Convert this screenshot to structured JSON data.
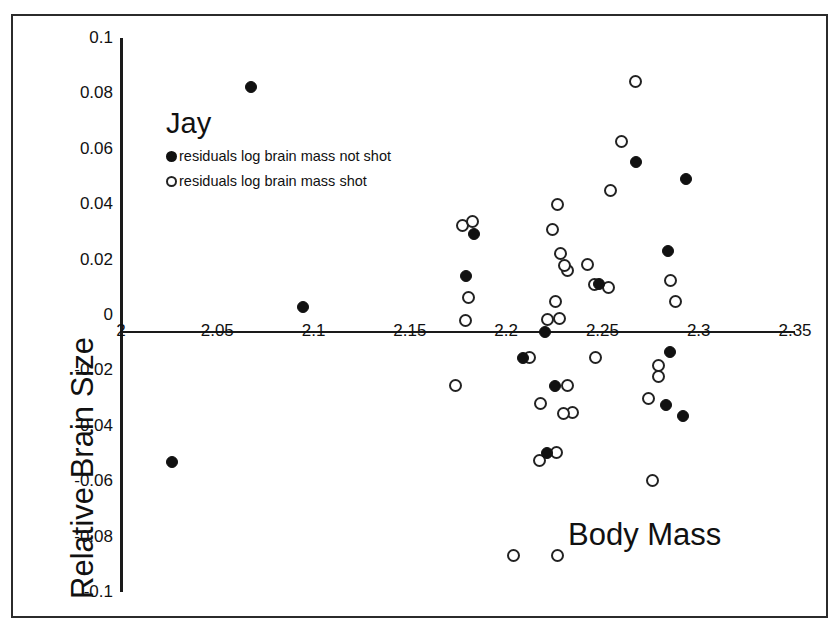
{
  "chart_data": {
    "type": "scatter",
    "title": "Jay",
    "xlabel": "Body Mass",
    "ylabel": "Relative Brain Size",
    "xlim": [
      2.0,
      2.35
    ],
    "ylim": [
      -0.1,
      0.1
    ],
    "xticks": [
      "2",
      "2.05",
      "2.1",
      "2.15",
      "2.2",
      "2.25",
      "2.3",
      "2.35"
    ],
    "xtick_values": [
      2.0,
      2.05,
      2.1,
      2.15,
      2.2,
      2.25,
      2.3,
      2.35
    ],
    "yticks": [
      "0.1",
      "0.08",
      "0.06",
      "0.04",
      "0.02",
      "0",
      "-0.02",
      "-0.04",
      "-0.06",
      "-0.08",
      "-0.1"
    ],
    "ytick_values": [
      0.1,
      0.08,
      0.06,
      0.04,
      0.02,
      0,
      -0.02,
      -0.04,
      -0.06,
      -0.08,
      -0.1
    ],
    "grid": false,
    "legend_position": "upper-left",
    "series": [
      {
        "name": "residuals log brain mass not shot",
        "marker": "filled-circle",
        "color": "#111111",
        "points": [
          [
            2.0675,
            0.0822
          ],
          [
            2.0945,
            0.003
          ],
          [
            2.0265,
            -0.0532
          ],
          [
            2.1835,
            0.0292
          ],
          [
            2.179,
            0.0141
          ],
          [
            2.2085,
            -0.0154
          ],
          [
            2.22,
            -0.0062
          ],
          [
            2.2255,
            -0.0258
          ],
          [
            2.221,
            -0.0497
          ],
          [
            2.248,
            0.0112
          ],
          [
            2.2675,
            0.0552
          ],
          [
            2.284,
            0.0231
          ],
          [
            2.285,
            -0.0135
          ],
          [
            2.283,
            -0.0325
          ],
          [
            2.292,
            -0.0365
          ],
          [
            2.2935,
            0.049
          ]
        ]
      },
      {
        "name": "residuals log brain mass shot",
        "marker": "open-circle",
        "color": "#222222",
        "points": [
          [
            2.1775,
            0.0323
          ],
          [
            2.1825,
            0.0338
          ],
          [
            2.1805,
            0.0064
          ],
          [
            2.179,
            -0.002
          ],
          [
            2.1735,
            -0.0255
          ],
          [
            2.212,
            -0.0155
          ],
          [
            2.218,
            -0.032
          ],
          [
            2.2265,
            0.04
          ],
          [
            2.224,
            0.0308
          ],
          [
            2.228,
            0.0221
          ],
          [
            2.232,
            0.016
          ],
          [
            2.2305,
            0.0178
          ],
          [
            2.2255,
            0.0048
          ],
          [
            2.2275,
            -0.0012
          ],
          [
            2.2215,
            -0.0018
          ],
          [
            2.242,
            0.0183
          ],
          [
            2.246,
            0.011
          ],
          [
            2.253,
            0.0098
          ],
          [
            2.26,
            0.0628
          ],
          [
            2.254,
            0.045
          ],
          [
            2.267,
            0.0842
          ],
          [
            2.2465,
            -0.0154
          ],
          [
            2.232,
            -0.0255
          ],
          [
            2.2345,
            -0.0352
          ],
          [
            2.23,
            -0.0355
          ],
          [
            2.2175,
            -0.0525
          ],
          [
            2.226,
            -0.0498
          ],
          [
            2.279,
            -0.0222
          ],
          [
            2.279,
            -0.0184
          ],
          [
            2.274,
            -0.0302
          ],
          [
            2.276,
            -0.0598
          ],
          [
            2.288,
            0.0048
          ],
          [
            2.2855,
            0.0125
          ],
          [
            2.204,
            -0.087
          ],
          [
            2.2265,
            -0.087
          ]
        ]
      }
    ]
  }
}
